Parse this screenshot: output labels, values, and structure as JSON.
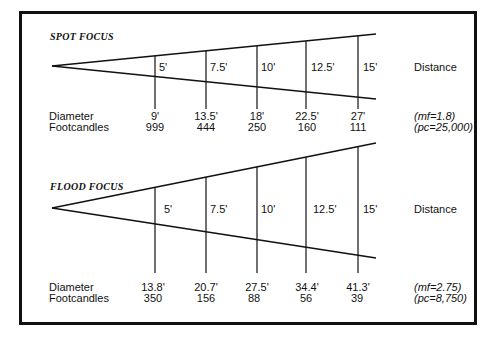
{
  "spot": {
    "title": "SPOT FOCUS",
    "distance_label": "Distance",
    "distances": [
      "5'",
      "7.5'",
      "10'",
      "12.5'",
      "15'"
    ],
    "row_labels": {
      "diameter": "Diameter",
      "footcandles": "Footcandles"
    },
    "diameters": [
      "9'",
      "13.5'",
      "18'",
      "22.5'",
      "27'"
    ],
    "footcandles": [
      "999",
      "444",
      "250",
      "160",
      "111"
    ],
    "mf": "(mf=1.8)",
    "pc": "(pc=25,000)"
  },
  "flood": {
    "title": "FLOOD  FOCUS",
    "distance_label": "Distance",
    "distances": [
      "5'",
      "7.5'",
      "10'",
      "12.5'",
      "15'"
    ],
    "row_labels": {
      "diameter": "Diameter",
      "footcandles": "Footcandles"
    },
    "diameters": [
      "13.8'",
      "20.7'",
      "27.5'",
      "34.4'",
      "41.3'"
    ],
    "footcandles": [
      "350",
      "156",
      "88",
      "56",
      "39"
    ],
    "mf": "(mf=2.75)",
    "pc": "(pc=8,750)"
  },
  "colors": {
    "line": "#111111",
    "background": "#ffffff"
  }
}
